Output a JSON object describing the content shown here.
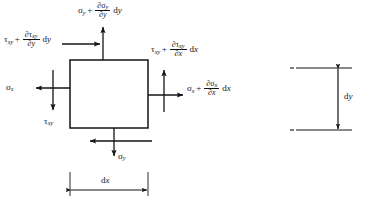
{
  "figure": {
    "type": "free-body-diagram",
    "stroke_color": "#141414",
    "background": "#ffffff"
  },
  "element": {
    "name": "differential-element",
    "shape": "rectangle",
    "x": 70,
    "y": 60,
    "width": 78,
    "height": 68
  },
  "labels": {
    "top_normal": {
      "base": "σ",
      "base_sub": "y",
      "operator": "+",
      "numerator_partial": "∂σ",
      "numerator_sub": "y",
      "denominator_partial": "∂",
      "denominator_var": "y",
      "differential": "d",
      "differential_var": "y",
      "plain": "σy + ∂σy/∂y dy"
    },
    "left_shear_top": {
      "base": "τ",
      "base_sub": "xy",
      "operator": "+",
      "numerator_partial": "∂τ",
      "numerator_sub": "xy",
      "denominator_partial": "∂",
      "denominator_var": "y",
      "differential": "d",
      "differential_var": "y",
      "plain": "τxy + ∂τxy/∂y dy"
    },
    "right_shear": {
      "base": "τ",
      "base_sub": "xy",
      "operator": "+",
      "numerator_partial": "∂τ",
      "numerator_sub": "xy",
      "denominator_partial": "∂",
      "denominator_var": "x",
      "differential": "d",
      "differential_var": "x",
      "plain": "τxy + ∂τxy/∂x dx"
    },
    "right_normal": {
      "base": "σ",
      "base_sub": "x",
      "operator": "+",
      "numerator_partial": "∂σ",
      "numerator_sub": "x",
      "denominator_partial": "∂",
      "denominator_var": "x",
      "differential": "d",
      "differential_var": "x",
      "plain": "σx + ∂σx/∂x dx"
    },
    "left_normal": {
      "base": "σ",
      "base_sub": "x",
      "plain": "σx"
    },
    "left_shear_bottom": {
      "base": "τ",
      "base_sub": "xy",
      "plain": "τxy"
    },
    "bottom_normal": {
      "base": "σ",
      "base_sub": "y",
      "plain": "σy"
    }
  },
  "dimensions": {
    "dx": {
      "label_d": "d",
      "label_var": "x",
      "plain": "dx",
      "orientation": "horizontal"
    },
    "dy": {
      "label_d": "d",
      "label_var": "y",
      "plain": "dy",
      "orientation": "vertical"
    }
  },
  "arrows": [
    {
      "name": "arrow-top-normal-up",
      "direction": "up"
    },
    {
      "name": "arrow-top-shear-right",
      "direction": "right"
    },
    {
      "name": "arrow-left-normal-left",
      "direction": "left"
    },
    {
      "name": "arrow-left-shear-down",
      "direction": "down"
    },
    {
      "name": "arrow-right-normal-right",
      "direction": "right"
    },
    {
      "name": "arrow-right-shear-up",
      "direction": "up"
    },
    {
      "name": "arrow-bottom-normal-down",
      "direction": "down"
    },
    {
      "name": "arrow-bottom-shear-left",
      "direction": "left"
    }
  ]
}
